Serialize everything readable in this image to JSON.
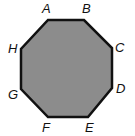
{
  "diagram": {
    "shape": "octagon",
    "fill_color": "#8c8c8c",
    "stroke_color": "#111111",
    "vertices": [
      {
        "label": "A",
        "x": 48,
        "y": 20,
        "lx": 42,
        "ly": 13
      },
      {
        "label": "B",
        "x": 84,
        "y": 20,
        "lx": 82,
        "ly": 13
      },
      {
        "label": "C",
        "x": 112,
        "y": 48,
        "lx": 115,
        "ly": 52
      },
      {
        "label": "D",
        "x": 112,
        "y": 88,
        "lx": 116,
        "ly": 93
      },
      {
        "label": "E",
        "x": 88,
        "y": 117,
        "lx": 85,
        "ly": 132
      },
      {
        "label": "F",
        "x": 48,
        "y": 117,
        "lx": 42,
        "ly": 132
      },
      {
        "label": "G",
        "x": 21,
        "y": 89,
        "lx": 8,
        "ly": 99
      },
      {
        "label": "H",
        "x": 21,
        "y": 49,
        "lx": 8,
        "ly": 53
      }
    ]
  }
}
